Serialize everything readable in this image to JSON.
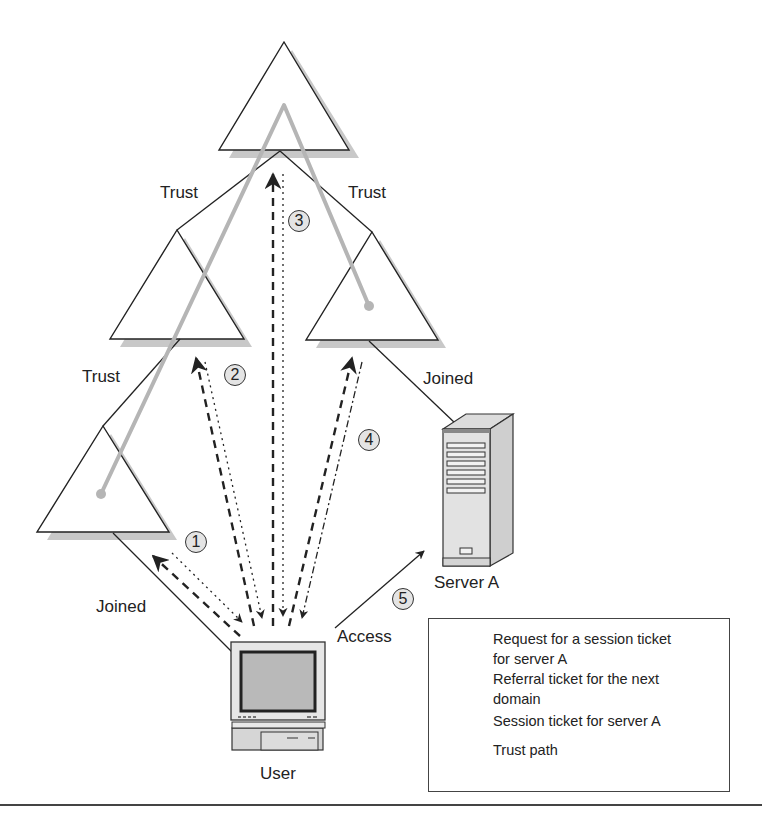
{
  "labels": {
    "trust_top_left": "Trust",
    "trust_top_right": "Trust",
    "trust_mid_left": "Trust",
    "joined_right": "Joined",
    "joined_left": "Joined",
    "access": "Access",
    "server": "Server A",
    "user": "User"
  },
  "steps": [
    "1",
    "2",
    "3",
    "4",
    "5"
  ],
  "legend": {
    "items": [
      {
        "icon": "dashed-arrow",
        "label_line1": "Request for a session ticket",
        "label_line2": "for server A"
      },
      {
        "icon": "dotted-arrow",
        "label_line1": "Referral ticket for the next",
        "label_line2": "domain"
      },
      {
        "icon": "dash-dot-arrow",
        "label_line1": "Session ticket for server A"
      },
      {
        "icon": "trust-path-line",
        "label_line1": "Trust path"
      }
    ]
  },
  "colors": {
    "line": "#222222",
    "shadow": "#c8c8c8",
    "trust_path": "#b5b5b5",
    "step_fill": "#e4e4e4"
  }
}
